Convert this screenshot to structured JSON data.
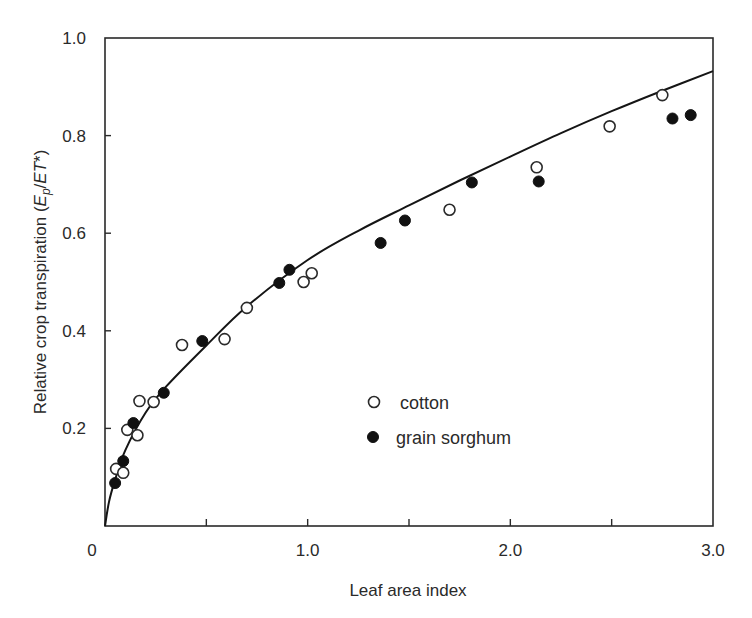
{
  "chart_data": {
    "type": "scatter",
    "title": "",
    "xlabel": "Leaf area index",
    "ylabel_parts": {
      "prefix": "Relative crop transpiration (",
      "E": "E",
      "sub": "p",
      "slash": "/",
      "ET": "ET",
      "suffix": "*)"
    },
    "ylabel": "Relative crop transpiration (Ep/ET*)",
    "xlim": [
      0,
      3.0
    ],
    "ylim": [
      0,
      1.0
    ],
    "grid": false,
    "legend_position": "inside-center",
    "x_ticks": [
      {
        "value": 0,
        "label": "0"
      },
      {
        "value": 0.5,
        "label": ""
      },
      {
        "value": 1.0,
        "label": "1.0"
      },
      {
        "value": 1.5,
        "label": ""
      },
      {
        "value": 2.0,
        "label": "2.0"
      },
      {
        "value": 2.5,
        "label": ""
      },
      {
        "value": 3.0,
        "label": "3.0"
      }
    ],
    "y_ticks": [
      {
        "value": 0.2,
        "label": "0.2"
      },
      {
        "value": 0.4,
        "label": "0.4"
      },
      {
        "value": 0.6,
        "label": "0.6"
      },
      {
        "value": 0.8,
        "label": "0.8"
      },
      {
        "value": 1.0,
        "label": "1.0"
      }
    ],
    "origin_label": "0",
    "series": [
      {
        "name": "cotton",
        "marker": "open-circle",
        "points": [
          [
            0.055,
            0.117
          ],
          [
            0.09,
            0.109
          ],
          [
            0.11,
            0.197
          ],
          [
            0.16,
            0.186
          ],
          [
            0.17,
            0.256
          ],
          [
            0.24,
            0.254
          ],
          [
            0.38,
            0.371
          ],
          [
            0.59,
            0.383
          ],
          [
            0.7,
            0.447
          ],
          [
            0.98,
            0.5
          ],
          [
            1.02,
            0.518
          ],
          [
            1.7,
            0.648
          ],
          [
            2.13,
            0.735
          ],
          [
            2.49,
            0.819
          ],
          [
            2.75,
            0.883
          ]
        ]
      },
      {
        "name": "grain sorghum",
        "marker": "filled-circle",
        "points": [
          [
            0.05,
            0.088
          ],
          [
            0.09,
            0.133
          ],
          [
            0.14,
            0.211
          ],
          [
            0.29,
            0.273
          ],
          [
            0.48,
            0.379
          ],
          [
            0.86,
            0.498
          ],
          [
            0.91,
            0.525
          ],
          [
            1.36,
            0.58
          ],
          [
            1.48,
            0.626
          ],
          [
            1.81,
            0.704
          ],
          [
            2.14,
            0.706
          ],
          [
            2.8,
            0.835
          ],
          [
            2.89,
            0.842
          ]
        ]
      }
    ],
    "fitted_curve": {
      "name": "fit",
      "style": "solid-line",
      "points": [
        [
          0,
          0
        ],
        [
          0.02,
          0.05
        ],
        [
          0.05,
          0.095
        ],
        [
          0.1,
          0.155
        ],
        [
          0.2,
          0.232
        ],
        [
          0.3,
          0.285
        ],
        [
          0.5,
          0.37
        ],
        [
          0.7,
          0.45
        ],
        [
          1.0,
          0.545
        ],
        [
          1.25,
          0.605
        ],
        [
          1.5,
          0.657
        ],
        [
          1.75,
          0.708
        ],
        [
          2.0,
          0.757
        ],
        [
          2.25,
          0.805
        ],
        [
          2.5,
          0.85
        ],
        [
          2.75,
          0.892
        ],
        [
          3.0,
          0.932
        ]
      ]
    }
  },
  "legend": {
    "items": [
      {
        "label": "cotton",
        "marker": "open-circle"
      },
      {
        "label": "grain sorghum",
        "marker": "filled-circle"
      }
    ]
  },
  "colors": {
    "ink": "#2a2a2a",
    "background": "#ffffff"
  }
}
